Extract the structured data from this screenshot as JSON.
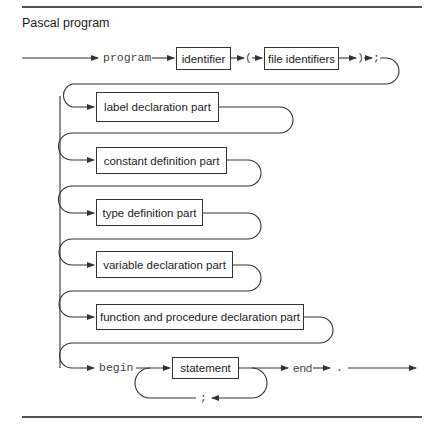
{
  "title": "Pascal program",
  "diagram": {
    "type": "syntax-diagram",
    "keywords": {
      "program": "program",
      "begin": "begin",
      "end": "end"
    },
    "symbols": {
      "open_paren": "(",
      "close_paren": ")",
      "semicolon_header": ";",
      "semicolon_loop": ";",
      "period": "."
    },
    "boxes": {
      "identifier": "identifier",
      "file_identifiers": "file identifiers",
      "label_declaration": "label declaration part",
      "constant_definition": "constant definition part",
      "type_definition": "type definition part",
      "variable_declaration": "variable declaration part",
      "function_procedure_declaration": "function and procedure declaration part",
      "statement": "statement"
    },
    "sequence": [
      "program",
      "identifier",
      "(",
      "file identifiers",
      ")",
      ";",
      "label declaration part",
      "constant definition part",
      "type definition part",
      "variable declaration part",
      "function and procedure declaration part",
      "begin",
      "statement",
      "end",
      "."
    ],
    "colors": {
      "line": "#333333",
      "background": "#ffffff"
    }
  }
}
